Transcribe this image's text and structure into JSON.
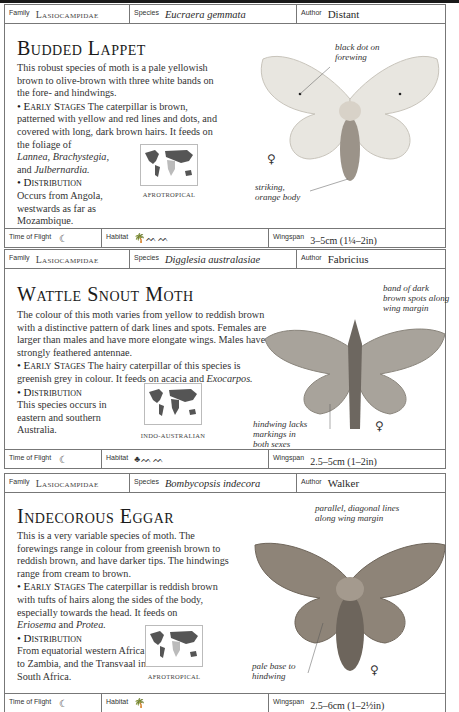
{
  "labels": {
    "family": "Family",
    "species": "Species",
    "author": "Author",
    "time_of_flight": "Time of Flight",
    "habitat": "Habitat",
    "wingspan": "Wingspan"
  },
  "entries": [
    {
      "family": "Lasiocampidae",
      "species": "Eucraera gemmata",
      "author": "Distant",
      "title": "Budded Lappet",
      "intro": "This robust species of moth is a pale yellowish brown to olive-brown with three white bands on the fore- and hindwings.",
      "early_heading": "• Early Stages",
      "early_text_1": "The caterpillar is brown, patterned with yellow and red lines and dots, and covered with long, dark brown hairs. It feeds on the foliage of",
      "early_plants": "Lannea, Brachystegia,",
      "early_and": "and",
      "early_plants_2": "Julbernardia.",
      "dist_heading": "• Distribution",
      "dist_text": "Occurs from Angola, westwards as far as Mozambique.",
      "region": "AFROTROPICAL",
      "annotations": [
        "black dot on forewing",
        "striking, orange body"
      ],
      "sex_symbol": "♀",
      "flight_icon": "crescent-moon-icon",
      "flight_glyph": "☾",
      "habitat_icons": [
        "palm-tree-icon",
        "grassland-icon"
      ],
      "habitat_glyphs": "🌴 ᨓᨓ",
      "wingspan": "3–5cm (1¼–2in)"
    },
    {
      "family": "Lasiocampidae",
      "species": "Digglesia australasiae",
      "author": "Fabricius",
      "title": "Wattle Snout Moth",
      "intro": "The colour of this moth varies from yellow to reddish brown with a distinctive pattern of dark lines and spots. Females are larger than males and have more elongate wings. Males have strongly feathered antennae.",
      "early_heading": "• Early Stages",
      "early_text_1": "The hairy caterpillar of this species is greenish grey in colour. It feeds on acacia and",
      "early_plants": "Exocarpos.",
      "dist_heading": "• Distribution",
      "dist_text": "This species occurs in eastern and southern Australia.",
      "region": "INDO-AUSTRALIAN",
      "annotations": [
        "band of dark brown spots along wing margin",
        "hindwing lacks markings in both sexes"
      ],
      "sex_symbol": "♀",
      "flight_icon": "crescent-moon-icon",
      "flight_glyph": "☾",
      "habitat_icons": [
        "broadleaf-tree-icon",
        "grassland-icon"
      ],
      "habitat_glyphs": "ᨓᨓ",
      "wingspan": "2.5–5cm (1–2in)"
    },
    {
      "family": "Lasiocampidae",
      "species": "Bombycopsis indecora",
      "author": "Walker",
      "title": "Indecorous Eggar",
      "intro": "This is a very variable species of moth. The forewings range in colour from greenish brown to reddish brown, and have darker tips. The hindwings range from cream to brown.",
      "early_heading": "• Early Stages",
      "early_text_1": "The caterpillar is reddish brown with tufts of hairs along the sides of the body, especially towards the head. It feeds on",
      "early_plants": "Eriosema",
      "early_and": "and",
      "early_plants_2": "Protea.",
      "dist_heading": "• Distribution",
      "dist_text": "From equatorial western Africa to Zambia, and the Transvaal in South Africa.",
      "region": "AFROTROPICAL",
      "annotations": [
        "parallel, diagonal lines along wing margin",
        "pale base to hindwing"
      ],
      "sex_symbol": "♀",
      "flight_icon": "crescent-moon-icon",
      "flight_glyph": "☾",
      "habitat_icons": [
        "palm-tree-icon"
      ],
      "wingspan": "2.5–6cm (1–2½in)"
    }
  ]
}
